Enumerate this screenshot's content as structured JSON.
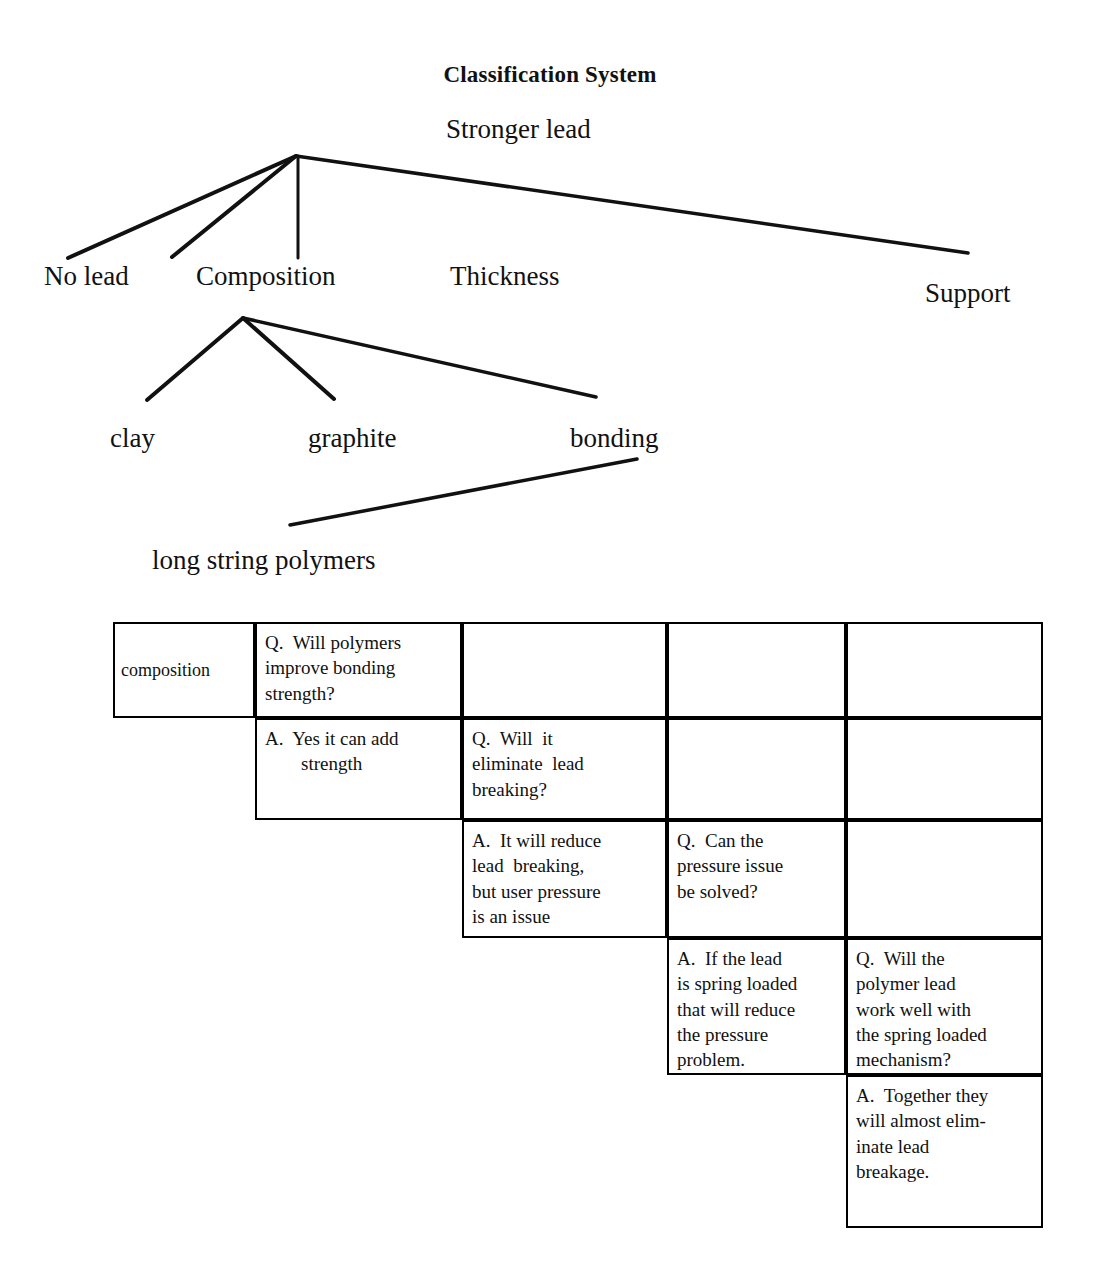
{
  "document": {
    "title": "Classification System"
  },
  "tree": {
    "root": "Stronger lead",
    "level2": [
      {
        "key": "no-lead",
        "label": "No lead"
      },
      {
        "key": "composition",
        "label": "Composition"
      },
      {
        "key": "thickness",
        "label": "Thickness"
      },
      {
        "key": "support",
        "label": "Support"
      }
    ],
    "level3": [
      {
        "key": "clay",
        "label": "clay"
      },
      {
        "key": "graphite",
        "label": "graphite"
      },
      {
        "key": "bonding",
        "label": "bonding"
      }
    ],
    "level4": [
      {
        "key": "long-string-polymers",
        "label": "long string polymers"
      }
    ],
    "line_color": "#111111"
  },
  "qa_table": {
    "row_label": "composition",
    "cells": [
      {
        "id": "q1",
        "type": "question",
        "row": 1,
        "column": 2,
        "lines": [
          "Q.  Will polymers",
          "improve bonding",
          "strength?"
        ]
      },
      {
        "id": "a1",
        "type": "answer",
        "row": 2,
        "column": 2,
        "lines": [
          "A.  Yes it can add",
          "strength"
        ]
      },
      {
        "id": "q2",
        "type": "question",
        "row": 2,
        "column": 3,
        "lines": [
          "Q.  Will  it",
          "eliminate  lead",
          "breaking?"
        ]
      },
      {
        "id": "a2",
        "type": "answer",
        "row": 3,
        "column": 3,
        "lines": [
          "A.  It will reduce",
          "lead  breaking,",
          "but user pressure",
          "is an issue"
        ]
      },
      {
        "id": "q3",
        "type": "question",
        "row": 3,
        "column": 4,
        "lines": [
          "Q.  Can the",
          "pressure issue",
          "be solved?"
        ]
      },
      {
        "id": "a3",
        "type": "answer",
        "row": 4,
        "column": 4,
        "lines": [
          "A.  If the lead",
          "is spring loaded",
          "that will reduce",
          "the pressure",
          "problem."
        ]
      },
      {
        "id": "q4",
        "type": "question",
        "row": 4,
        "column": 5,
        "lines": [
          "Q.  Will the",
          "polymer lead",
          "work well with",
          "the spring loaded",
          "mechanism?"
        ]
      },
      {
        "id": "a4",
        "type": "answer",
        "row": 5,
        "column": 5,
        "lines": [
          "A.  Together they",
          "will almost elim-",
          "inate lead",
          "breakage."
        ]
      }
    ]
  }
}
